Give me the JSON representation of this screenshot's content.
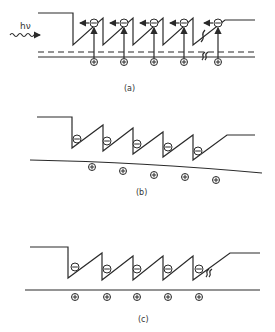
{
  "figure": {
    "colors": {
      "ink": "#2a2a2a",
      "background": "#ffffff"
    },
    "symbols": {
      "electron": "−",
      "hole": "+"
    },
    "panels": [
      {
        "id": "a",
        "label": "(a)",
        "photon_label": "hν",
        "electrons": 5,
        "holes": 5,
        "features": [
          "incident photon wave",
          "electron drift arrows",
          "photoexcitation arrows",
          "recombination marks",
          "dashed quasi-Fermi level"
        ]
      },
      {
        "id": "b",
        "label": "(b)",
        "electrons": 5,
        "holes": 5,
        "features": [
          "tilted valence band"
        ]
      },
      {
        "id": "c",
        "label": "(c)",
        "electrons": 5,
        "holes": 5,
        "features": [
          "flat valence band",
          "recombination mark"
        ]
      }
    ]
  }
}
